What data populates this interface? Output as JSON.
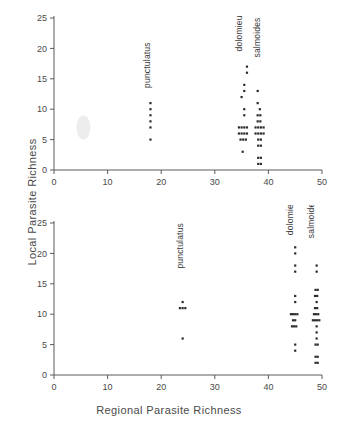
{
  "figure": {
    "xlabel": "Regional Parasite Richness",
    "ylabel": "Local Parasite Richness"
  },
  "chart_data": [
    {
      "type": "scatter",
      "panel": "top",
      "title": "",
      "xlabel": "",
      "ylabel": "Local Parasite Richness",
      "xlim": [
        0,
        50
      ],
      "ylim": [
        0,
        25
      ],
      "xticks": [
        0,
        10,
        20,
        30,
        40,
        50
      ],
      "yticks": [
        0,
        5,
        10,
        15,
        20,
        25
      ],
      "grid": false,
      "legend": "none",
      "annotations": [
        {
          "text": "punctulatus",
          "x": 18,
          "y": 13.5,
          "rotation": -90
        },
        {
          "text": "dolomieu",
          "x": 35,
          "y": 19.5,
          "rotation": -90
        },
        {
          "text": "salmoides",
          "x": 38.5,
          "y": 18.5,
          "rotation": -90
        }
      ],
      "series": [
        {
          "name": "punctulatus",
          "points": [
            {
              "x": 18,
              "y": 11
            },
            {
              "x": 18,
              "y": 10
            },
            {
              "x": 18,
              "y": 9
            },
            {
              "x": 18,
              "y": 8
            },
            {
              "x": 18,
              "y": 7
            },
            {
              "x": 18,
              "y": 5
            }
          ]
        },
        {
          "name": "dolomieu",
          "points": [
            {
              "x": 36,
              "y": 17
            },
            {
              "x": 36,
              "y": 16
            },
            {
              "x": 35.5,
              "y": 14
            },
            {
              "x": 35.5,
              "y": 13
            },
            {
              "x": 35,
              "y": 12
            },
            {
              "x": 35.5,
              "y": 10
            },
            {
              "x": 35.5,
              "y": 9
            },
            {
              "x": 34.5,
              "y": 7
            },
            {
              "x": 35,
              "y": 7
            },
            {
              "x": 35.5,
              "y": 7
            },
            {
              "x": 36,
              "y": 7
            },
            {
              "x": 34.5,
              "y": 6
            },
            {
              "x": 35,
              "y": 6
            },
            {
              "x": 35.5,
              "y": 6
            },
            {
              "x": 36,
              "y": 6
            },
            {
              "x": 34.8,
              "y": 5
            },
            {
              "x": 35.3,
              "y": 5
            },
            {
              "x": 35.8,
              "y": 5
            },
            {
              "x": 35.2,
              "y": 3
            }
          ]
        },
        {
          "name": "salmoides",
          "points": [
            {
              "x": 38,
              "y": 13
            },
            {
              "x": 38,
              "y": 11
            },
            {
              "x": 38.4,
              "y": 10
            },
            {
              "x": 38,
              "y": 9
            },
            {
              "x": 38.5,
              "y": 9
            },
            {
              "x": 38,
              "y": 8
            },
            {
              "x": 38.5,
              "y": 8
            },
            {
              "x": 37.6,
              "y": 7
            },
            {
              "x": 38.1,
              "y": 7
            },
            {
              "x": 38.6,
              "y": 7
            },
            {
              "x": 39.1,
              "y": 7
            },
            {
              "x": 37.6,
              "y": 6
            },
            {
              "x": 38.1,
              "y": 6
            },
            {
              "x": 38.6,
              "y": 6
            },
            {
              "x": 39.1,
              "y": 6
            },
            {
              "x": 38.1,
              "y": 5
            },
            {
              "x": 38.6,
              "y": 5
            },
            {
              "x": 38.1,
              "y": 4
            },
            {
              "x": 38.6,
              "y": 4
            },
            {
              "x": 38.1,
              "y": 2
            },
            {
              "x": 38.6,
              "y": 2
            },
            {
              "x": 38.1,
              "y": 1
            },
            {
              "x": 38.6,
              "y": 1
            }
          ]
        }
      ]
    },
    {
      "type": "scatter",
      "panel": "bottom",
      "title": "",
      "xlabel": "Regional Parasite Richness",
      "ylabel": "Local Parasite Richness",
      "xlim": [
        0,
        50
      ],
      "ylim": [
        0,
        25
      ],
      "xticks": [
        0,
        10,
        20,
        30,
        40,
        50
      ],
      "yticks": [
        0,
        5,
        10,
        15,
        20,
        25
      ],
      "grid": false,
      "legend": "none",
      "annotations": [
        {
          "text": "punctulatus",
          "x": 24,
          "y": 17.5,
          "rotation": -90
        },
        {
          "text": "dolomieu",
          "x": 44.5,
          "y": 23,
          "rotation": -90
        },
        {
          "text": "salmoides",
          "x": 48.5,
          "y": 22.5,
          "rotation": -90
        }
      ],
      "series": [
        {
          "name": "punctulatus",
          "points": [
            {
              "x": 24,
              "y": 12
            },
            {
              "x": 23.5,
              "y": 11
            },
            {
              "x": 24,
              "y": 11
            },
            {
              "x": 24.5,
              "y": 11
            },
            {
              "x": 24,
              "y": 6
            }
          ]
        },
        {
          "name": "dolomieu",
          "points": [
            {
              "x": 45,
              "y": 21
            },
            {
              "x": 45,
              "y": 20
            },
            {
              "x": 45,
              "y": 18
            },
            {
              "x": 45,
              "y": 17
            },
            {
              "x": 45,
              "y": 13
            },
            {
              "x": 45,
              "y": 12
            },
            {
              "x": 44.2,
              "y": 10
            },
            {
              "x": 44.6,
              "y": 10
            },
            {
              "x": 45,
              "y": 10
            },
            {
              "x": 45.4,
              "y": 10
            },
            {
              "x": 44.6,
              "y": 9
            },
            {
              "x": 45,
              "y": 9
            },
            {
              "x": 44.4,
              "y": 8
            },
            {
              "x": 44.8,
              "y": 8
            },
            {
              "x": 45.2,
              "y": 8
            },
            {
              "x": 45,
              "y": 5
            },
            {
              "x": 45,
              "y": 4
            }
          ]
        },
        {
          "name": "salmoides",
          "points": [
            {
              "x": 49,
              "y": 18
            },
            {
              "x": 49,
              "y": 17
            },
            {
              "x": 48.8,
              "y": 14
            },
            {
              "x": 49.2,
              "y": 14
            },
            {
              "x": 48.7,
              "y": 13
            },
            {
              "x": 49.1,
              "y": 13
            },
            {
              "x": 49,
              "y": 12
            },
            {
              "x": 48.7,
              "y": 11
            },
            {
              "x": 49.1,
              "y": 11
            },
            {
              "x": 48.5,
              "y": 10
            },
            {
              "x": 48.9,
              "y": 10
            },
            {
              "x": 49.3,
              "y": 10
            },
            {
              "x": 48.3,
              "y": 9
            },
            {
              "x": 48.7,
              "y": 9
            },
            {
              "x": 49.1,
              "y": 9
            },
            {
              "x": 49.5,
              "y": 9
            },
            {
              "x": 49,
              "y": 8
            },
            {
              "x": 49,
              "y": 7
            },
            {
              "x": 49,
              "y": 6
            },
            {
              "x": 48.8,
              "y": 5
            },
            {
              "x": 49.2,
              "y": 5
            },
            {
              "x": 48.8,
              "y": 3
            },
            {
              "x": 49.2,
              "y": 3
            },
            {
              "x": 48.8,
              "y": 2
            },
            {
              "x": 49.2,
              "y": 2
            }
          ]
        }
      ]
    }
  ]
}
